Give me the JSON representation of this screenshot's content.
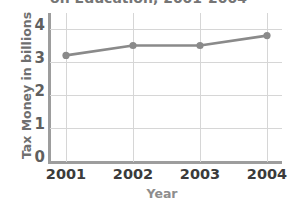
{
  "chart_data": {
    "type": "line",
    "title": "on Education, 2001-2004",
    "title_note": "top of title clipped by image edge",
    "xlabel": "Year",
    "ylabel": "Tax Money in billions",
    "categories": [
      "2001",
      "2002",
      "2003",
      "2004"
    ],
    "values": [
      3.2,
      3.5,
      3.5,
      3.8
    ],
    "series": [
      {
        "name": "Tax Money in billions",
        "values": [
          3.2,
          3.5,
          3.5,
          3.8
        ]
      }
    ],
    "ylim": [
      0,
      4.5
    ],
    "y_ticks": [
      "0",
      "1",
      "2",
      "3",
      "4"
    ],
    "y_tick_values": [
      0,
      1,
      2,
      3,
      4
    ],
    "x_ticks": [
      "2001",
      "2002",
      "2003",
      "2004"
    ],
    "grid": true,
    "grid_horizontal": true,
    "grid_vertical": true,
    "legend": false,
    "legend_position": "none",
    "marker": "circle",
    "colors": {
      "line": "#8a8a8a",
      "marker": "#8a8a8a",
      "grid": "#d6d6d6",
      "axis": "#9d9d9d",
      "title_text": "#757575",
      "y_axis_title_text": "#6f6f6f",
      "x_axis_title_text": "#8d8d8d",
      "y_tick_text": "#5f5f5f",
      "x_tick_text": "#3b3b3b",
      "background": "#ffffff"
    }
  }
}
